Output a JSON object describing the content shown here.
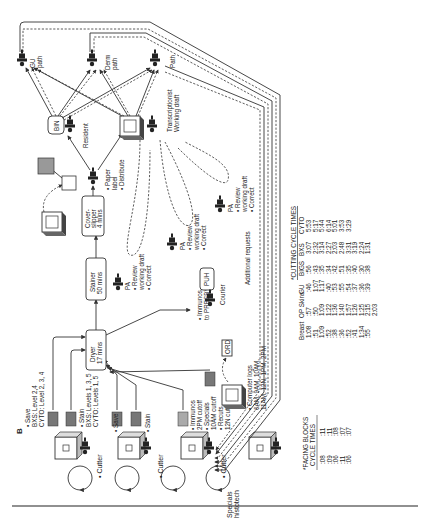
{
  "figure": {
    "panel_label": "B",
    "orientation": "rotated 90 degrees counter-clockwise"
  },
  "stations": {
    "cutters": [
      {
        "label": "• Cutter",
        "notes": [
          "• Save",
          "BXS:  Level 2,4",
          "CYTO: Level 2, 3, 4"
        ],
        "notes2": [
          "• Stain",
          "BXS:  Levels 1, 3, 5",
          "CYTO: Levels 1, 5"
        ]
      },
      {
        "label": "• Cutter",
        "notes": [
          "• Save"
        ],
        "notes2": [
          "• Stain"
        ]
      },
      {
        "label": "• Cutter",
        "notes": [],
        "notes2": []
      },
      {
        "label": "Specials histotech",
        "notes": [
          "• Immunos",
          "2PM cutoff",
          "• Specials",
          "10AM cutoff",
          "• Recuts",
          "12N cutoff"
        ],
        "notes2": []
      }
    ],
    "dryer": {
      "line1": "Dryer",
      "line2": "17 mins"
    },
    "stainer": {
      "line1": "Stainer",
      "line2": "50 mins"
    },
    "coverslipper": {
      "line1": "Cover-",
      "line2": "slipper",
      "line3": "4 mins"
    },
    "immunos_presby": [
      "• Immunos",
      "to PRESBY"
    ],
    "puh": "PUH",
    "courier": "Courier",
    "computer_logs": {
      "label": "• Computer logs",
      "times": [
        "6AM, 9AM, 10AM,",
        "11AM, 12N, 1PM, 2PM"
      ],
      "badge": "ORD"
    },
    "paper_label": [
      "• Paper",
      "label",
      "• Distribute"
    ],
    "bin": "BIN",
    "resident": "Resident",
    "transcriptionist": [
      "Transcriptionist",
      "Working draft"
    ],
    "pa_reviews": [
      {
        "role": "PA",
        "items": [
          "• Review",
          "working draft",
          "• Correct"
        ]
      },
      {
        "role": "PA",
        "items": [
          "• Review",
          "working draft",
          "• Correct"
        ]
      },
      {
        "role": "PA",
        "items": [
          "• Review",
          "working draft",
          "• Correct"
        ]
      }
    ],
    "pathologists": [
      {
        "label": [
          "GU",
          "path"
        ]
      },
      {
        "label": [
          "Derm",
          "path"
        ]
      },
      {
        "label": [
          "Path"
        ]
      }
    ],
    "additional_requests": "Additional requests"
  },
  "tables": {
    "cutting_cycle_times": {
      "title": "*CUTTING CYCLE TIMES",
      "columns": [
        "Breast",
        "OP Skins",
        "GU",
        "BIGS",
        "BXS",
        "CYTO"
      ],
      "rows": [
        [
          "1:08",
          ":57",
          ":46",
          ":56",
          "3:07",
          "5:53"
        ],
        [
          ":51",
          ":50",
          "1:07",
          ":43",
          "2:32",
          "5:17"
        ],
        [
          "1:09",
          "1:09",
          "1:17",
          ":35",
          "3:14",
          "5:44"
        ],
        [
          ":52",
          "1:22",
          ":40",
          ":34",
          "2:27",
          "6:14"
        ],
        [
          ":38",
          "1:36",
          ":53",
          ":42",
          "2:03",
          "5:01"
        ],
        [
          ":36",
          "1:40",
          ":55",
          ":51",
          "2:48",
          "3:53"
        ],
        [
          ":52",
          "1:57",
          ":54",
          ":35",
          "3:31",
          "3:29"
        ],
        [
          ":41",
          "1:26",
          ":37",
          ":40",
          "3:19",
          ""
        ],
        [
          "1:34",
          "1:25",
          ":36",
          ":30",
          "2:24",
          ""
        ],
        [
          ":55",
          "2:15",
          ":39",
          ":38",
          "1:31",
          ""
        ],
        [
          "",
          "2:03",
          "",
          "",
          "",
          ""
        ]
      ]
    },
    "facing_blocks_cycle_times": {
      "title": [
        "*FACING BLOCKS",
        "CYCLE TIMES"
      ],
      "rows": [
        [
          ":08",
          ":11"
        ],
        [
          ":09",
          ":11"
        ],
        [
          ":06",
          ":08"
        ],
        [
          ":11",
          ":07"
        ],
        [
          ":06",
          ":07"
        ]
      ]
    }
  }
}
